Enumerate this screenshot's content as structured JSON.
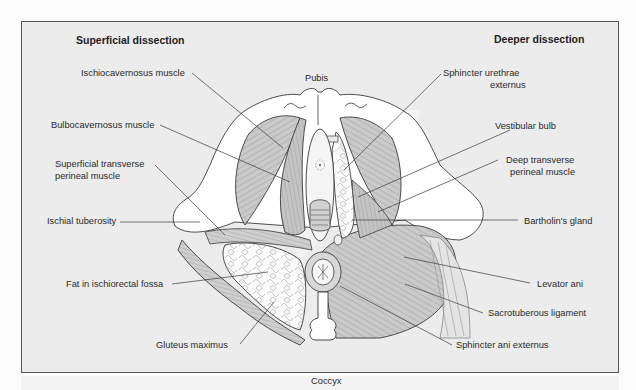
{
  "diagram": {
    "headings": {
      "left": "Superficial dissection",
      "right": "Deeper dissection"
    },
    "landmarks": {
      "top": "Pubis",
      "bottom": "Coccyx"
    },
    "left_labels": [
      {
        "id": "ischiocavernosus",
        "text": "Ischiocavernosus muscle"
      },
      {
        "id": "bulbocavernosus",
        "text": "Bulbocavernosus muscle"
      },
      {
        "id": "superficial_transverse_1",
        "text": "Superficial transverse"
      },
      {
        "id": "superficial_transverse_2",
        "text": "perineal muscle"
      },
      {
        "id": "ischial_tuberosity",
        "text": "Ischial tuberosity"
      },
      {
        "id": "fat_fossa",
        "text": "Fat in ischiorectal fossa"
      },
      {
        "id": "gluteus",
        "text": "Gluteus maximus"
      }
    ],
    "right_labels": [
      {
        "id": "sphincter_urethrae_1",
        "text": "Sphincter urethrae"
      },
      {
        "id": "sphincter_urethrae_2",
        "text": "externus"
      },
      {
        "id": "vestibular_bulb",
        "text": "Vestibular bulb"
      },
      {
        "id": "deep_transverse_1",
        "text": "Deep transverse"
      },
      {
        "id": "deep_transverse_2",
        "text": "perineal muscle"
      },
      {
        "id": "bartholin",
        "text": "Bartholin's gland"
      },
      {
        "id": "levator_ani",
        "text": "Levator ani"
      },
      {
        "id": "sacrotuberous",
        "text": "Sacrotuberous ligament"
      },
      {
        "id": "sphincter_ani",
        "text": "Sphincter ani externus"
      }
    ],
    "colors": {
      "background": "#ececec",
      "frame_border": "#555555",
      "muscle_fill": "#c8c8c8",
      "line": "#3a3a3a",
      "bone": "#ffffff"
    }
  }
}
